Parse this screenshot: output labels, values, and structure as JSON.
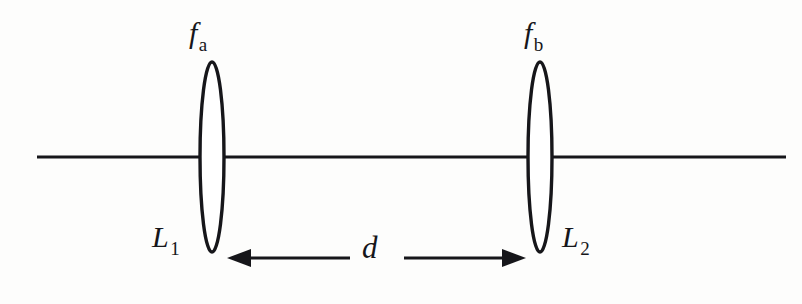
{
  "figure": {
    "background_color": "#fdfdfc",
    "ink_color": "#16161a"
  },
  "optical_axis": {
    "name": "optical-axis",
    "x_start": 37,
    "x_end": 786,
    "y": 157
  },
  "lenses": [
    {
      "id": "lens-1",
      "label": "L",
      "label_sub": "1",
      "focal_label": "f",
      "focal_sub": "a",
      "center_x": 212,
      "center_y": 157,
      "half_width": 12,
      "half_height": 95
    },
    {
      "id": "lens-2",
      "label": "L",
      "label_sub": "2",
      "focal_label": "f",
      "focal_sub": "b",
      "center_x": 540,
      "center_y": 157,
      "half_width": 12,
      "half_height": 95
    }
  ],
  "dimension": {
    "name": "separation-distance",
    "label": "d",
    "y": 258,
    "left_tip_x": 227,
    "right_tip_x": 526,
    "gap_left_x": 350,
    "gap_right_x": 404,
    "arrow_direction": "double"
  }
}
